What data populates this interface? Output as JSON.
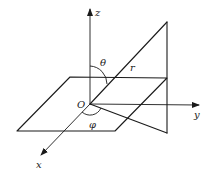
{
  "figure": {
    "labels": {
      "z_axis": "z",
      "y_axis": "y",
      "x_axis": "x",
      "origin": "O",
      "theta": "θ",
      "phi": "φ",
      "radius": "r"
    }
  },
  "geometry": {
    "origin": [
      90,
      104
    ],
    "z_axis_end": [
      90,
      8
    ],
    "y_axis_end": [
      200,
      105
    ],
    "x_axis_end": [
      40,
      156
    ],
    "horizontal_plane": [
      [
        70,
        77
      ],
      [
        167,
        78
      ],
      [
        115,
        131
      ],
      [
        17,
        131
      ]
    ],
    "vertical_triangle": [
      [
        90,
        104
      ],
      [
        167,
        22
      ],
      [
        167,
        133
      ]
    ]
  }
}
